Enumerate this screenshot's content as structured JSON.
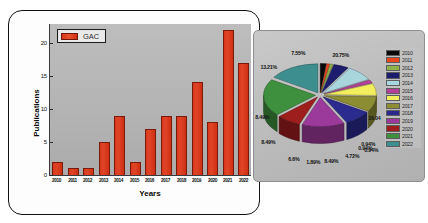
{
  "bar_panel": {
    "legend_label": "GAC",
    "y_axis_title": "Publications",
    "x_axis_title": "Years"
  },
  "pie_panel": {
    "legend_title": ""
  },
  "chart_data": [
    {
      "type": "bar",
      "title": "",
      "xlabel": "Years",
      "ylabel": "Publications",
      "legend": [
        "GAC"
      ],
      "legend_position": "top-left",
      "grid": false,
      "ylim": [
        0,
        23
      ],
      "yticks": [
        0,
        5,
        10,
        15,
        20
      ],
      "categories": [
        "2010",
        "2011",
        "2012",
        "2013",
        "2014",
        "2015",
        "2016",
        "2017",
        "2018",
        "2019",
        "2020",
        "2021",
        "2022"
      ],
      "values": [
        2,
        1,
        1,
        5,
        9,
        2,
        7,
        9,
        9,
        14,
        8,
        22,
        17
      ],
      "series_color": "#d8361c",
      "plot_background": "#b6b6b6"
    },
    {
      "type": "pie",
      "title": "",
      "three_d": true,
      "exploded": true,
      "legend_position": "right",
      "labels": [
        "2010",
        "2011",
        "2012",
        "2013",
        "2014",
        "2015",
        "2016",
        "2017",
        "2018",
        "2019",
        "2020",
        "2021",
        "2022"
      ],
      "values": [
        1.89,
        0.94,
        0.94,
        4.72,
        8.49,
        1.89,
        6.6,
        8.49,
        8.49,
        13.21,
        7.55,
        20.75,
        16.04
      ],
      "value_labels": [
        "1.89%",
        "0.94%",
        "0.94%",
        "4.72%",
        "8.49%",
        "1.89%",
        "6.6%",
        "8.49%",
        "8.49%",
        "13.21%",
        "7.55%",
        "20.75%",
        "16.04"
      ],
      "colors": [
        "#0a0a0a",
        "#e8441e",
        "#8fb04a",
        "#1d1d6e",
        "#a9d5dd",
        "#b5409a",
        "#f3ef5c",
        "#8d8d33",
        "#2a2a8f",
        "#9c3a9c",
        "#9e1d1d",
        "#3e8f3e",
        "#3d8f8f"
      ]
    }
  ],
  "pie_labels_positioned": [
    {
      "text": "20.75%",
      "x": 78,
      "y": 21
    },
    {
      "text": "7.55%",
      "x": 37,
      "y": 19
    },
    {
      "text": "13.21%",
      "x": 6,
      "y": 33
    },
    {
      "text": "8.49%",
      "x": 1,
      "y": 83
    },
    {
      "text": "8.49%",
      "x": 7,
      "y": 108
    },
    {
      "text": "6.6%",
      "x": 34,
      "y": 125
    },
    {
      "text": "1.89%",
      "x": 52,
      "y": 128
    },
    {
      "text": "8.49%",
      "x": 70,
      "y": 127
    },
    {
      "text": "4.72%",
      "x": 91,
      "y": 122
    },
    {
      "text": "0.94%",
      "x": 104,
      "y": 114
    },
    {
      "text": "0.94%",
      "x": 107,
      "y": 110
    },
    {
      "text": "0.94%",
      "x": 110,
      "y": 116
    },
    {
      "text": "16.04",
      "x": 114,
      "y": 84
    }
  ],
  "pie_legend": [
    {
      "year": "2010",
      "color": "#0a0a0a"
    },
    {
      "year": "2011",
      "color": "#e8441e"
    },
    {
      "year": "2012",
      "color": "#8fb04a"
    },
    {
      "year": "2013",
      "color": "#1d1d6e"
    },
    {
      "year": "2014",
      "color": "#a9d5dd"
    },
    {
      "year": "2015",
      "color": "#b5409a"
    },
    {
      "year": "2016",
      "color": "#f3ef5c"
    },
    {
      "year": "2017",
      "color": "#8d8d33"
    },
    {
      "year": "2018",
      "color": "#2a2a8f"
    },
    {
      "year": "2019",
      "color": "#9c3a9c"
    },
    {
      "year": "2020",
      "color": "#9e1d1d"
    },
    {
      "year": "2021",
      "color": "#3e8f3e"
    },
    {
      "year": "2022",
      "color": "#3d8f8f"
    }
  ]
}
